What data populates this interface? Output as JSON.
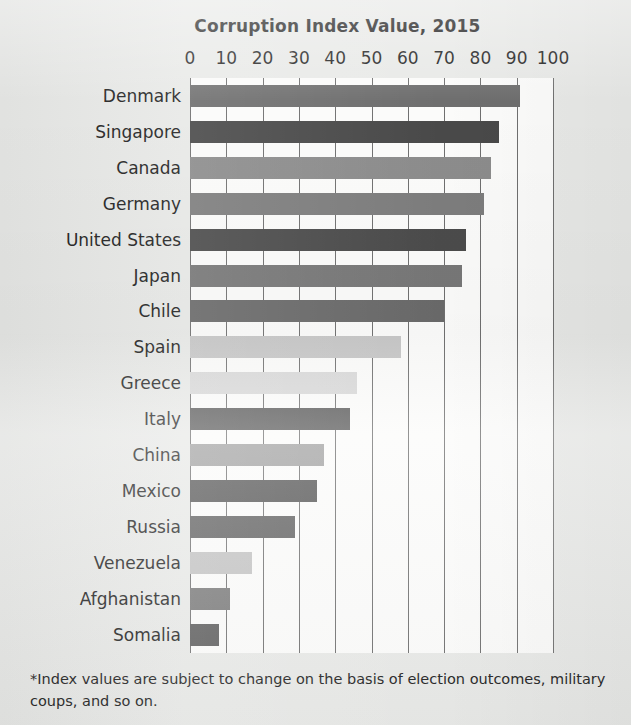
{
  "chart_data": {
    "type": "bar",
    "orientation": "horizontal",
    "title": "Corruption Index Value, 2015",
    "xlabel": "",
    "ylabel": "",
    "xlim": [
      0,
      100
    ],
    "grid": true,
    "legend": null,
    "tick_labels": [
      "0",
      "10",
      "20",
      "30",
      "40",
      "50",
      "60",
      "70",
      "80",
      "90",
      "100"
    ],
    "ticks": [
      0,
      10,
      20,
      30,
      40,
      50,
      60,
      70,
      80,
      90,
      100
    ],
    "categories": [
      "Denmark",
      "Singapore",
      "Canada",
      "Germany",
      "United States",
      "Japan",
      "Chile",
      "Spain",
      "Greece",
      "Italy",
      "China",
      "Mexico",
      "Russia",
      "Venezuela",
      "Afghanistan",
      "Somalia"
    ],
    "values": [
      91,
      85,
      83,
      81,
      76,
      75,
      70,
      58,
      46,
      44,
      37,
      35,
      29,
      17,
      11,
      8
    ],
    "bar_colors": [
      "#6e6e6e",
      "#494949",
      "#8c8c8c",
      "#7d7d7d",
      "#4b4b4b",
      "#777777",
      "#6a6a6a",
      "#c6c6c6",
      "#d8d8d8",
      "#5a5a5a",
      "#a0a0a0",
      "#545454",
      "#5f5f5f",
      "#c2c2c2",
      "#787878",
      "#5c5c5c"
    ],
    "annotations": [
      "*Index values are subject to change on the basis of election outcomes, military coups, and so on."
    ]
  },
  "footnote": "*Index values are subject to change on the basis of election outcomes, military coups, and so on.",
  "colors": {
    "page_background": "#e8e9e7",
    "plot_background": "#fbfbfa",
    "gridline": "#6f6f6f",
    "text": "#1d1d1d"
  }
}
